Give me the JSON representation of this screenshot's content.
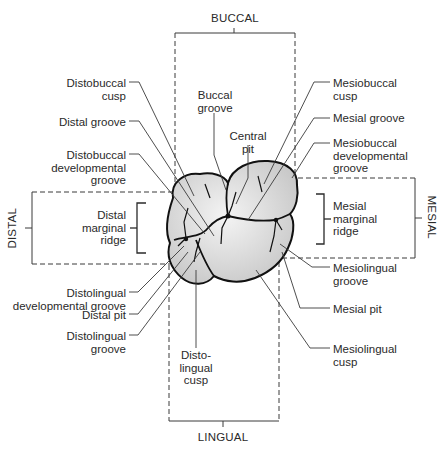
{
  "diagram": {
    "orientation": {
      "top": "BUCCAL",
      "bottom": "LINGUAL",
      "left": "DISTAL",
      "right": "MESIAL"
    },
    "labels_left": {
      "distobuccal_cusp": "Distobuccal\ncusp",
      "distal_groove": "Distal groove",
      "distobuccal_dev_groove": "Distobuccal\ndevelopmental\ngroove",
      "distal_marginal_ridge": "Distal\nmarginal\nridge",
      "distolingual_dev_groove": "Distolingual\ndevelopmental groove",
      "distal_pit": "Distal pit",
      "distolingual_groove": "Distolingual\ngroove"
    },
    "labels_center": {
      "buccal_groove": "Buccal\ngroove",
      "central_pit": "Central\npit",
      "distolingual_cusp": "Disto-\nlingual\ncusp"
    },
    "labels_right": {
      "mesiobuccal_cusp": "Mesiobuccal\ncusp",
      "mesial_groove": "Mesial groove",
      "mesiobuccal_dev_groove": "Mesiobuccal\ndevelopmental\ngroove",
      "mesial_marginal_ridge": "Mesial\nmarginal\nridge",
      "mesiolingual_groove": "Mesiolingual\ngroove",
      "mesial_pit": "Mesial pit",
      "mesiolingual_cusp": "Mesiolingual\ncusp"
    },
    "colors": {
      "line": "#3a3a3a",
      "outline": "#111111",
      "tooth_fill": "#dcdcdc",
      "text": "#2a2a2a"
    }
  }
}
